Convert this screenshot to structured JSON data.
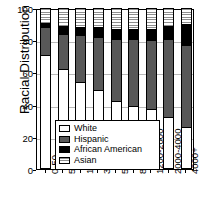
{
  "chart_data": {
    "type": "bar",
    "subtype": "stacked-percentage",
    "title": "",
    "xlabel": "",
    "ylabel": "Racial Distribution",
    "ylim": [
      0,
      100
    ],
    "yticks": [
      0,
      20,
      40,
      60,
      80,
      100
    ],
    "grid": true,
    "legend_position": "inside-bottom-left",
    "categories": [
      "0-50",
      "50-100",
      "150-300",
      "300-500",
      "500-800",
      "800-1200",
      "1200-2000",
      "2000-4000",
      "4000+"
    ],
    "series": [
      {
        "name": "White",
        "color": "#ffffff",
        "pattern": "solid",
        "values": [
          71,
          62,
          54,
          49,
          42,
          39,
          37,
          32,
          26
        ]
      },
      {
        "name": "Hispanic",
        "color": "#585858",
        "pattern": "solid",
        "values": [
          17,
          22,
          29,
          33,
          39,
          42,
          43,
          49,
          51
        ]
      },
      {
        "name": "African American",
        "color": "#000000",
        "pattern": "solid",
        "values": [
          3,
          5,
          5,
          6,
          6,
          6,
          7,
          8,
          13
        ]
      },
      {
        "name": "Asian",
        "color": "#8e8e8e",
        "pattern": "horizontal-stripes",
        "values": [
          9,
          11,
          12,
          12,
          13,
          13,
          13,
          11,
          10
        ]
      }
    ]
  },
  "axis": {
    "y_title": "Racial Distribution",
    "y_ticks": [
      "0",
      "20",
      "40",
      "60",
      "80",
      "100"
    ]
  },
  "legend": {
    "items": [
      {
        "label": "White",
        "swatch": "sw-white"
      },
      {
        "label": "Hispanic",
        "swatch": "sw-hispanic"
      },
      {
        "label": "African American",
        "swatch": "sw-african"
      },
      {
        "label": "Asian",
        "swatch": "sw-asian"
      }
    ]
  }
}
